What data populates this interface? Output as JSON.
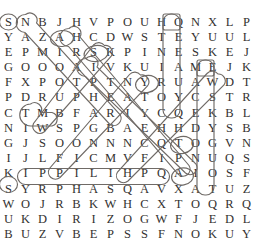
{
  "puzzle": {
    "type": "word-search",
    "rows": 15,
    "cols": 15,
    "grid": [
      [
        "S",
        "N",
        "B",
        "J",
        "H",
        "V",
        "P",
        "O",
        "U",
        "H",
        "Q",
        "N",
        "X",
        "L",
        "P"
      ],
      [
        "Y",
        "A",
        "Z",
        "A",
        "H",
        "C",
        "D",
        "W",
        "S",
        "T",
        "E",
        "Y",
        "U",
        "U",
        "L"
      ],
      [
        "E",
        "P",
        "M",
        "I",
        "R",
        "S",
        "K",
        "P",
        "I",
        "N",
        "E",
        "S",
        "K",
        "E",
        "J"
      ],
      [
        "G",
        "O",
        "O",
        "O",
        "A",
        "I",
        "V",
        "K",
        "U",
        "I",
        "A",
        "M",
        "E",
        "J",
        "K"
      ],
      [
        "F",
        "X",
        "P",
        "O",
        "T",
        "P",
        "T",
        "N",
        "Y",
        "R",
        "U",
        "A",
        "W",
        "D",
        "T"
      ],
      [
        "P",
        "D",
        "R",
        "U",
        "P",
        "H",
        "E",
        "A",
        "T",
        "O",
        "Y",
        "C",
        "S",
        "T",
        "R"
      ],
      [
        "C",
        "T",
        "M",
        "B",
        "F",
        "A",
        "R",
        "I",
        "Y",
        "C",
        "Q",
        "E",
        "K",
        "B",
        "L"
      ],
      [
        "N",
        "I",
        "W",
        "S",
        "P",
        "G",
        "B",
        "A",
        "E",
        "H",
        "H",
        "D",
        "Y",
        "S",
        "B"
      ],
      [
        "G",
        "J",
        "S",
        "O",
        "O",
        "N",
        "N",
        "N",
        "C",
        "Q",
        "T",
        "O",
        "G",
        "V",
        "N"
      ],
      [
        "I",
        "J",
        "L",
        "F",
        "I",
        "C",
        "M",
        "V",
        "F",
        "I",
        "P",
        "N",
        "U",
        "Q",
        "S"
      ],
      [
        "K",
        "I",
        "P",
        "P",
        "I",
        "L",
        "I",
        "H",
        "P",
        "Q",
        "A",
        "I",
        "O",
        "S",
        "F"
      ],
      [
        "S",
        "Y",
        "R",
        "P",
        "H",
        "A",
        "S",
        "Q",
        "A",
        "V",
        "X",
        "A",
        "T",
        "U",
        "Z"
      ],
      [
        "W",
        "O",
        "J",
        "R",
        "B",
        "K",
        "W",
        "H",
        "C",
        "X",
        "T",
        "O",
        "Q",
        "R",
        "Q"
      ],
      [
        "U",
        "K",
        "D",
        "I",
        "R",
        "I",
        "Z",
        "O",
        "G",
        "W",
        "F",
        "J",
        "E",
        "D",
        "L",
        "T"
      ],
      [
        "B",
        "U",
        "Z",
        "V",
        "B",
        "E",
        "P",
        "S",
        "S",
        "F",
        "N",
        "O",
        "K",
        "U",
        "Y",
        "C"
      ]
    ],
    "marked_words": [
      {
        "text": "SAMOTHRACE",
        "direction": "diagonal-down-right",
        "start_row": 0,
        "start_col": 0
      },
      {
        "text": "CORINTH",
        "direction": "vertical-up",
        "start_row": 6,
        "start_col": 9
      },
      {
        "text": "MACEDONIA",
        "direction": "vertical-down",
        "start_row": 3,
        "start_col": 11
      },
      {
        "text": "PHILIPPI",
        "direction": "horizontal-left",
        "start_row": 10,
        "start_col": 8
      },
      {
        "text": "ATHENS",
        "direction": "diagonal-down-left",
        "start_row": 2,
        "start_col": 5
      },
      {
        "text": "THESSALONICA",
        "direction": "diagonal-down-right",
        "start_row": 1,
        "start_col": 3
      },
      {
        "text": "NEAPOLIS",
        "direction": "diagonal-down-left",
        "start_row": 4,
        "start_col": 7
      },
      {
        "text": "TROAS",
        "direction": "diagonal-down-left",
        "start_row": 6,
        "start_col": 1
      }
    ],
    "colors": {
      "letter": "#33312f",
      "mark_stroke": "#6f6a66",
      "background": "#ffffff"
    }
  }
}
